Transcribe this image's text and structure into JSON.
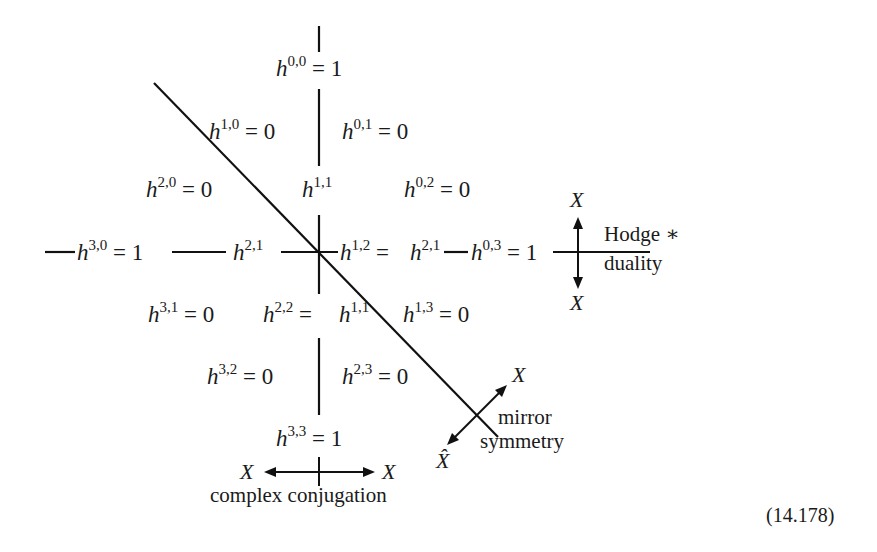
{
  "diagram": {
    "type": "hodge-diamond",
    "equation_number": "(14.178)",
    "terms": [
      {
        "id": "h00",
        "base": "h",
        "sup": "0,0",
        "rest": " = 1",
        "x": 276,
        "y": 76
      },
      {
        "id": "h10",
        "base": "h",
        "sup": "1,0",
        "rest": " = 0",
        "x": 209,
        "y": 139
      },
      {
        "id": "h01",
        "base": "h",
        "sup": "0,1",
        "rest": " = 0",
        "x": 342,
        "y": 139
      },
      {
        "id": "h20",
        "base": "h",
        "sup": "2,0",
        "rest": " = 0",
        "x": 146,
        "y": 197
      },
      {
        "id": "h11",
        "base": "h",
        "sup": "1,1",
        "rest": "",
        "x": 302,
        "y": 197
      },
      {
        "id": "h02",
        "base": "h",
        "sup": "0,2",
        "rest": " = 0",
        "x": 404,
        "y": 197
      },
      {
        "id": "h30",
        "base": "h",
        "sup": "3,0",
        "rest": " = 1",
        "x": 77,
        "y": 260
      },
      {
        "id": "h21",
        "base": "h",
        "sup": "2,1",
        "rest": "",
        "x": 233,
        "y": 260
      },
      {
        "id": "h12",
        "base": "h",
        "sup": "1,2",
        "rest": " = ",
        "x": 340,
        "y": 260
      },
      {
        "id": "h21b",
        "base": "h",
        "sup": "2,1",
        "rest": "",
        "x": 410,
        "y": 260
      },
      {
        "id": "h03",
        "base": "h",
        "sup": "0,3",
        "rest": " = 1",
        "x": 471,
        "y": 260
      },
      {
        "id": "h31",
        "base": "h",
        "sup": "3,1",
        "rest": " = 0",
        "x": 148,
        "y": 322
      },
      {
        "id": "h22",
        "base": "h",
        "sup": "2,2",
        "rest": " = ",
        "x": 263,
        "y": 322
      },
      {
        "id": "h11b",
        "base": "h",
        "sup": "1,1",
        "rest": "",
        "x": 339,
        "y": 322
      },
      {
        "id": "h13",
        "base": "h",
        "sup": "1,3",
        "rest": " = 0",
        "x": 403,
        "y": 322
      },
      {
        "id": "h32",
        "base": "h",
        "sup": "3,2",
        "rest": " = 0",
        "x": 207,
        "y": 384
      },
      {
        "id": "h23",
        "base": "h",
        "sup": "2,3",
        "rest": " = 0",
        "x": 342,
        "y": 384
      },
      {
        "id": "h33",
        "base": "h",
        "sup": "3,3",
        "rest": " = 1",
        "x": 276,
        "y": 446
      }
    ],
    "annotations": {
      "hodge_star": {
        "line1": "Hodge ∗",
        "line2": "duality",
        "top_label": "X",
        "bottom_label": "X"
      },
      "mirror_symmetry": {
        "line1": "mirror",
        "line2": "symmetry",
        "upper_label": "X",
        "lower_label": "X̂"
      },
      "complex_conjugation": {
        "label": "complex conjugation",
        "left_label": "X",
        "right_label": "X"
      }
    }
  }
}
